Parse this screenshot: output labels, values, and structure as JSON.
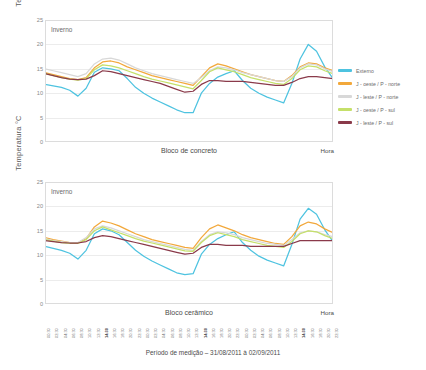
{
  "caption": "Período de medição – 31/08/2011 à 02/09/2011",
  "axis": {
    "ylabel": "Temperatura °C",
    "xlabel": "Hora",
    "yticks": [
      "25",
      "20",
      "15",
      "10",
      "5",
      "0"
    ]
  },
  "season_note": "Inverno",
  "legend_items": [
    {
      "label": "Externo",
      "color": "#4ec3e0"
    },
    {
      "label": "J - oeste / P - norte",
      "color": "#f2a83b"
    },
    {
      "label": "J - leste / P - norte",
      "color": "#d8d8d8"
    },
    {
      "label": "J - oeste / P - sul",
      "color": "#c5e06a"
    },
    {
      "label": "J - leste / P - sul",
      "color": "#8a3a4a"
    }
  ],
  "panels": [
    {
      "name": "Bloco de concreto",
      "note": "Inverno"
    },
    {
      "name": "Bloco cerâmico",
      "note": "Inverno"
    }
  ],
  "xticklabels": [
    "00:30",
    "02:30",
    "04:30",
    "06:30",
    "08:30",
    "10:30",
    "12:30",
    "14:30",
    "16:30",
    "18:30",
    "20:30",
    "22:30",
    "00:30",
    "02:30",
    "04:30",
    "06:30",
    "08:30",
    "10:30",
    "12:30",
    "14:30",
    "16:30",
    "18:30",
    "20:30",
    "22:30",
    "00:30",
    "02:30",
    "04:30",
    "06:30",
    "08:30",
    "10:30",
    "12:30",
    "14:30",
    "16:30",
    "18:30",
    "20:30",
    "22:30"
  ],
  "xtickbold": [
    7,
    19,
    31
  ],
  "chart_data": {
    "type": "line",
    "title": "",
    "xlabel": "Hora",
    "ylabel": "Temperatura °C",
    "ylim": [
      0,
      25
    ],
    "grid": true,
    "legend_position": "right",
    "x": [
      "00:30",
      "02:30",
      "04:30",
      "06:30",
      "08:30",
      "10:30",
      "12:30",
      "14:30",
      "16:30",
      "18:30",
      "20:30",
      "22:30",
      "00:30",
      "02:30",
      "04:30",
      "06:30",
      "08:30",
      "10:30",
      "12:30",
      "14:30",
      "16:30",
      "18:30",
      "20:30",
      "22:30",
      "00:30",
      "02:30",
      "04:30",
      "06:30",
      "08:30",
      "10:30",
      "12:30",
      "14:30",
      "16:30",
      "18:30",
      "20:30",
      "22:30"
    ],
    "panels": [
      {
        "name": "Bloco de concreto",
        "annotation": "Inverno",
        "series": [
          {
            "name": "Externo",
            "color": "#4ec3e0",
            "values": [
              11.8,
              11.5,
              11.2,
              10.6,
              9.4,
              11.0,
              14.3,
              15.2,
              15.0,
              14.6,
              13.0,
              11.2,
              10.0,
              9.0,
              8.2,
              7.4,
              6.6,
              6.0,
              6.0,
              10.0,
              12.0,
              13.3,
              14.0,
              14.6,
              12.6,
              11.0,
              10.0,
              9.2,
              8.6,
              8.0,
              12.0,
              17.0,
              20.0,
              18.6,
              15.4,
              13.0
            ]
          },
          {
            "name": "J - oeste / P - norte",
            "color": "#f2a83b",
            "values": [
              14.2,
              13.8,
              13.4,
              13.0,
              12.8,
              13.2,
              15.2,
              16.4,
              16.6,
              16.2,
              15.4,
              14.8,
              14.2,
              13.6,
              13.2,
              12.8,
              12.4,
              12.0,
              11.6,
              13.4,
              15.2,
              16.0,
              15.6,
              15.0,
              14.4,
              13.8,
              13.4,
              13.0,
              12.6,
              12.4,
              13.6,
              15.4,
              16.2,
              16.0,
              15.2,
              14.6
            ]
          },
          {
            "name": "J - leste / P - norte",
            "color": "#d8d8d8",
            "values": [
              15.0,
              14.6,
              14.2,
              13.8,
              13.4,
              14.0,
              16.0,
              17.0,
              17.2,
              16.8,
              16.0,
              15.2,
              14.6,
              14.0,
              13.6,
              13.2,
              12.8,
              12.4,
              12.0,
              13.2,
              14.6,
              15.4,
              15.2,
              14.8,
              14.2,
              13.8,
              13.4,
              13.0,
              12.6,
              12.4,
              13.4,
              15.2,
              16.0,
              15.8,
              15.0,
              14.4
            ]
          },
          {
            "name": "J - oeste / P - sul",
            "color": "#c5e06a",
            "values": [
              14.0,
              13.6,
              13.2,
              12.9,
              12.7,
              13.0,
              14.8,
              15.8,
              15.6,
              15.2,
              14.6,
              14.0,
              13.4,
              12.9,
              12.5,
              12.1,
              11.7,
              11.3,
              10.9,
              12.6,
              14.4,
              15.2,
              14.8,
              14.4,
              13.8,
              13.2,
              12.8,
              12.4,
              12.0,
              11.8,
              13.0,
              14.8,
              15.6,
              15.4,
              14.6,
              14.0
            ]
          },
          {
            "name": "J - leste / P - sul",
            "color": "#8a3a4a",
            "values": [
              14.0,
              13.6,
              13.2,
              12.9,
              12.8,
              12.9,
              13.6,
              14.6,
              14.4,
              14.0,
              13.6,
              13.2,
              12.8,
              12.4,
              12.0,
              11.4,
              10.8,
              10.2,
              10.4,
              11.8,
              12.6,
              12.6,
              12.4,
              12.4,
              12.4,
              12.2,
              12.0,
              11.8,
              11.6,
              11.6,
              12.2,
              13.0,
              13.4,
              13.4,
              13.2,
              13.0
            ]
          }
        ]
      },
      {
        "name": "Bloco cerâmico",
        "annotation": "Inverno",
        "series": [
          {
            "name": "Externo",
            "color": "#4ec3e0",
            "values": [
              11.8,
              11.4,
              11.0,
              10.4,
              9.2,
              11.0,
              14.4,
              15.4,
              15.0,
              14.2,
              12.6,
              11.0,
              9.8,
              8.8,
              8.0,
              7.2,
              6.4,
              6.0,
              6.2,
              10.2,
              12.2,
              13.4,
              14.2,
              14.8,
              12.6,
              11.0,
              9.8,
              9.0,
              8.4,
              7.8,
              12.2,
              17.4,
              19.6,
              18.4,
              15.2,
              12.8
            ]
          },
          {
            "name": "J - oeste / P - norte",
            "color": "#f2a83b",
            "values": [
              13.6,
              13.2,
              12.9,
              12.6,
              12.5,
              13.4,
              15.8,
              17.0,
              16.6,
              16.0,
              15.2,
              14.4,
              13.8,
              13.2,
              12.8,
              12.4,
              12.0,
              11.6,
              11.4,
              13.6,
              15.4,
              16.2,
              15.6,
              15.0,
              14.2,
              13.6,
              13.2,
              12.8,
              12.4,
              12.2,
              13.8,
              16.0,
              16.8,
              16.4,
              15.4,
              14.6
            ]
          },
          {
            "name": "J - leste / P - norte",
            "color": "#d8d8d8",
            "values": [
              13.4,
              13.0,
              12.8,
              12.6,
              12.6,
              13.6,
              15.4,
              16.0,
              15.6,
              15.0,
              14.4,
              13.8,
              13.2,
              12.8,
              12.4,
              12.0,
              11.6,
              11.2,
              11.0,
              12.8,
              14.2,
              14.8,
              14.6,
              14.2,
              13.6,
              13.2,
              12.8,
              12.4,
              12.2,
              12.0,
              13.2,
              14.6,
              15.0,
              14.8,
              14.2,
              13.8
            ]
          },
          {
            "name": "J - oeste / P - sul",
            "color": "#c5e06a",
            "values": [
              13.2,
              12.9,
              12.6,
              12.4,
              12.4,
              13.2,
              15.0,
              15.8,
              15.2,
              14.6,
              14.0,
              13.4,
              12.9,
              12.5,
              12.1,
              11.7,
              11.3,
              10.9,
              10.8,
              12.6,
              14.0,
              14.6,
              14.2,
              13.8,
              13.2,
              12.8,
              12.4,
              12.0,
              11.8,
              11.6,
              12.8,
              14.4,
              15.0,
              14.8,
              14.0,
              13.4
            ]
          },
          {
            "name": "J - leste / P - sul",
            "color": "#8a3a4a",
            "values": [
              13.0,
              12.8,
              12.6,
              12.5,
              12.5,
              12.8,
              13.6,
              14.0,
              13.8,
              13.4,
              13.0,
              12.6,
              12.2,
              11.8,
              11.4,
              11.0,
              10.6,
              10.2,
              10.4,
              11.6,
              12.2,
              12.2,
              12.0,
              12.0,
              12.0,
              11.8,
              11.8,
              11.8,
              11.8,
              11.8,
              12.4,
              13.0,
              13.0,
              13.0,
              13.0,
              13.0
            ]
          }
        ]
      }
    ]
  }
}
